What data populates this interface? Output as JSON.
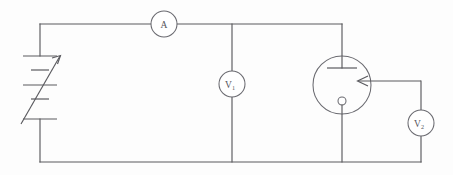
{
  "diagram": {
    "background_color": "#fdfdfd",
    "line_color": "#5a5a5f",
    "components": {
      "ammeter": {
        "label": "A",
        "symbol_name": "ammeter",
        "cx": 164,
        "cy": 24,
        "r": 13
      },
      "voltmeter_1": {
        "label": "V",
        "subscript": "1",
        "symbol_name": "voltmeter",
        "cx": 232,
        "cy": 84,
        "r": 13
      },
      "voltmeter_2": {
        "label": "V",
        "subscript": "2",
        "symbol_name": "voltmeter",
        "cx": 421,
        "cy": 123,
        "r": 13
      },
      "battery": {
        "symbol_name": "variable-battery",
        "cells": 2,
        "has_variable_arrow": true
      },
      "phototube": {
        "symbol_name": "phototube",
        "cx": 342,
        "cy": 85,
        "r": 29,
        "anode_name": "anode-plate",
        "cathode_name": "cathode-dot",
        "light_arrow_name": "light-arrow"
      }
    },
    "wires": {
      "top_rail_name": "top-rail",
      "bottom_rail_name": "bottom-rail",
      "left_rail_name": "left-rail",
      "v1_branch_name": "v1-branch",
      "v2_branch_name": "v2-branch"
    }
  }
}
